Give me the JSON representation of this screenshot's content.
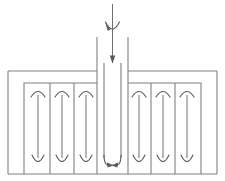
{
  "diagram": {
    "type": "schematic-flow-diagram",
    "canvas": {
      "width": 225,
      "height": 181
    },
    "colors": {
      "background": "#ffffff",
      "structure_stroke": "#808080",
      "flow_stroke": "#707070",
      "arrow_fill": "#5a5a5a"
    },
    "stroke_widths": {
      "structure": 1.1,
      "flow": 1.0,
      "marker": 1.1
    },
    "labels": {
      "inlet": "inlet",
      "central_channel": "central downcomer channel",
      "distribution_header": "distribution header",
      "outlet_channels": "parallel riser channels",
      "split_point": "flow split point"
    },
    "geometry": {
      "outer_left": 8,
      "outer_right": 217,
      "outer_top_y": 71,
      "outer_bottom_y": 174,
      "inner_left": 24,
      "inner_right": 201,
      "inner_top_y": 83,
      "channel_wall_left_x": 97,
      "channel_wall_right_x": 128,
      "channel_wall_top_y": 37,
      "channel_axis_x": 112.5,
      "inlet_arrow_top_y": 4,
      "inlet_arrow_tip_y": 33,
      "mid_arrow_tip_y": 62,
      "channel_bottom_y": 174
    },
    "central_channel": {
      "name": "central-downcomer",
      "inlet_arrow": {
        "name": "inlet-arrow",
        "direction": "down",
        "head_style": "open-vee",
        "start_y": 4,
        "tip_y": 33
      },
      "mid_arrow": {
        "name": "mid-channel-arrow",
        "direction": "down",
        "head_style": "solid-triangle",
        "start_y": 33,
        "tip_y": 63
      },
      "split_arrows": [
        {
          "name": "split-arrow-left",
          "direction": "down-left",
          "x": 106
        },
        {
          "name": "split-arrow-right",
          "direction": "down-right",
          "x": 119
        }
      ]
    },
    "left_bank": {
      "name": "left-channel-bank",
      "channel_count": 3,
      "divider_x": [
        24,
        59,
        94,
        97
      ],
      "channels": [
        {
          "name": "left-channel-1",
          "center_x": 41.5,
          "arc_marker": "up-arc",
          "vee_marker": "down-vee"
        },
        {
          "name": "left-channel-2",
          "center_x": 76.5,
          "arc_marker": "up-arc",
          "vee_marker": "down-vee"
        },
        {
          "name": "left-channel-3",
          "center_x": 97.0,
          "arc_marker": "up-arc",
          "vee_marker": "down-vee"
        }
      ]
    },
    "right_bank": {
      "name": "right-channel-bank",
      "channel_count": 3,
      "divider_x": [
        131,
        143,
        166,
        201
      ],
      "channels": [
        {
          "name": "right-channel-1",
          "center_x": 137.0,
          "arc_marker": "up-arc",
          "vee_marker": "down-vee"
        },
        {
          "name": "right-channel-2",
          "center_x": 166.0,
          "arc_marker": "up-arc",
          "vee_marker": "down-vee"
        },
        {
          "name": "right-channel-3",
          "center_x": 192.0,
          "arc_marker": "up-arc",
          "vee_marker": "down-vee"
        }
      ]
    }
  }
}
